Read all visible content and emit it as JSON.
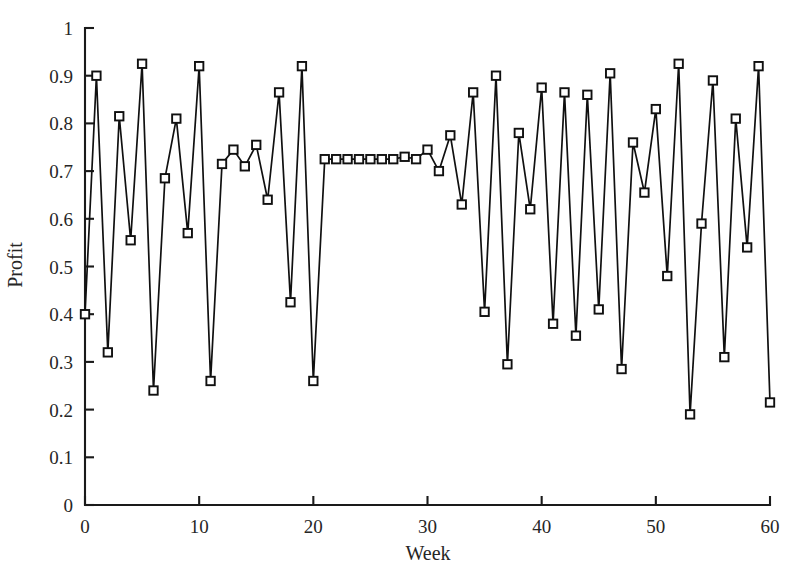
{
  "chart_data": {
    "type": "line",
    "title": "",
    "subtitle": "",
    "xlabel": "Week",
    "ylabel": "Profit",
    "xlim": [
      0,
      60
    ],
    "ylim": [
      0,
      1
    ],
    "grid": false,
    "legend": null,
    "marker": "open-square",
    "line_color": "#101010",
    "marker_face_color": "#ffffff",
    "xticks": [
      0,
      10,
      20,
      30,
      40,
      50,
      60
    ],
    "xtick_labels": [
      "0",
      "10",
      "20",
      "30",
      "40",
      "50",
      "60"
    ],
    "xminor_ticks": [],
    "yticks": [
      0,
      0.1,
      0.2,
      0.3,
      0.4,
      0.5,
      0.6,
      0.7,
      0.8,
      0.9,
      1
    ],
    "ytick_labels": [
      "0",
      "0.1",
      "0.2",
      "0.3",
      "0.4",
      "0.5",
      "0.6",
      "0.7",
      "0.8",
      "0.9",
      "1"
    ],
    "series": [
      {
        "name": "Profit",
        "x": [
          0,
          1,
          2,
          3,
          4,
          5,
          6,
          7,
          8,
          9,
          10,
          11,
          12,
          13,
          14,
          15,
          16,
          17,
          18,
          19,
          20,
          21,
          22,
          23,
          24,
          25,
          26,
          27,
          28,
          29,
          30,
          31,
          32,
          33,
          34,
          35,
          36,
          37,
          38,
          39,
          40,
          41,
          42,
          43,
          44,
          45,
          46,
          47,
          48,
          49,
          50,
          51,
          52,
          53,
          54,
          55,
          56,
          57,
          58,
          59,
          60
        ],
        "values": [
          0.4,
          0.9,
          0.32,
          0.815,
          0.555,
          0.925,
          0.24,
          0.685,
          0.81,
          0.57,
          0.92,
          0.26,
          0.715,
          0.745,
          0.71,
          0.755,
          0.64,
          0.865,
          0.425,
          0.92,
          0.26,
          0.725,
          0.725,
          0.725,
          0.725,
          0.725,
          0.725,
          0.725,
          0.73,
          0.725,
          0.745,
          0.7,
          0.775,
          0.63,
          0.865,
          0.405,
          0.9,
          0.295,
          0.78,
          0.62,
          0.875,
          0.38,
          0.865,
          0.355,
          0.86,
          0.41,
          0.905,
          0.285,
          0.76,
          0.655,
          0.83,
          0.48,
          0.925,
          0.19,
          0.59,
          0.89,
          0.31,
          0.81,
          0.54,
          0.92,
          0.215
        ]
      }
    ]
  },
  "axes": {
    "x_title": "Week",
    "y_title": "Profit"
  }
}
